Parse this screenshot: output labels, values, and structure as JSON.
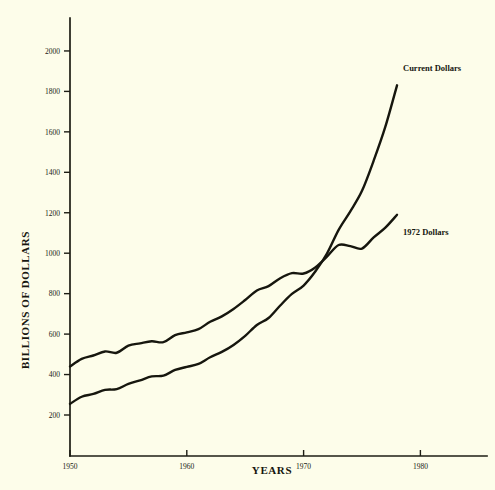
{
  "figure": {
    "background_color": "#fdfdea",
    "ink_color": "#16160e"
  },
  "chart_data": {
    "type": "line",
    "title": "",
    "subtitle": "",
    "xlabel": "YEARS",
    "ylabel": "BILLIONS OF DOLLARS",
    "xlim": [
      1949,
      1981
    ],
    "ylim": [
      0,
      2100
    ],
    "xticks": [
      1950,
      1960,
      1970,
      1980
    ],
    "xtick_labels": [
      "1950",
      "1960",
      "1970",
      "1980"
    ],
    "yticks": [
      200,
      400,
      600,
      800,
      1000,
      1200,
      1400,
      1600,
      1800,
      2000
    ],
    "ytick_labels": [
      "200",
      "400",
      "600",
      "800",
      "1000",
      "1200",
      "1400",
      "1600",
      "1800",
      "2000"
    ],
    "grid": false,
    "legend_position": "inline-annotation",
    "x": [
      1950,
      1951,
      1952,
      1953,
      1954,
      1955,
      1956,
      1957,
      1958,
      1959,
      1960,
      1961,
      1962,
      1963,
      1964,
      1965,
      1966,
      1967,
      1968,
      1969,
      1970,
      1971,
      1972,
      1973,
      1974,
      1975,
      1976,
      1977,
      1978
    ],
    "series": [
      {
        "name": "Current Dollars",
        "label": "Current Dollars",
        "color": "#16160e",
        "values": [
          287,
          331,
          348,
          373,
          378,
          410,
          432,
          456,
          461,
          496,
          515,
          533,
          574,
          607,
          650,
          706,
          773,
          816,
          893,
          964,
          1016,
          1102,
          1213,
          1359,
          1473,
          1599,
          1785,
          1994,
          2249
        ]
      },
      {
        "name": "1972 Dollars",
        "label": "1972 Dollars",
        "color": "#16160e",
        "values": [
          535,
          580,
          600,
          624,
          616,
          658,
          672,
          684,
          679,
          721,
          737,
          756,
          800,
          832,
          876,
          929,
          985,
          1011,
          1058,
          1088,
          1086,
          1122,
          1186,
          1255,
          1248,
          1234,
          1300,
          1358,
          1434
        ]
      }
    ],
    "annotations": [
      {
        "text": "Current Dollars",
        "x": 1978.5,
        "y": 1890
      },
      {
        "text": "1972 Dollars",
        "x": 1978.5,
        "y": 1240
      }
    ]
  },
  "axes": {
    "y_axis_title": "BILLIONS OF DOLLARS",
    "x_axis_title": "YEARS"
  }
}
